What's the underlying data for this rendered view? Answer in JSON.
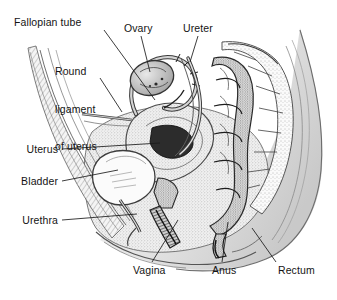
{
  "figure": {
    "width": 337,
    "height": 300,
    "background_color": "#ffffff",
    "ink_color": "#141414",
    "style": "grayscale pen-and-ink anatomical illustration with stippling and cross-hatching"
  },
  "labels": {
    "fallopian_tube": "Fallopian tube",
    "round_ligament_line1": "Round",
    "round_ligament_line2": "ligament",
    "round_ligament_line3": "of uterus",
    "ovary": "Ovary",
    "ureter": "Ureter",
    "uterus": "Uterus",
    "bladder": "Bladder",
    "urethra": "Urethra",
    "vagina": "Vagina",
    "anus": "Anus",
    "rectum": "Rectum"
  },
  "label_positions": {
    "fallopian_tube": {
      "x": 14,
      "y": 16,
      "align": "left"
    },
    "round_ligament": {
      "x": 55,
      "y": 40,
      "align": "left"
    },
    "ovary": {
      "x": 124,
      "y": 28,
      "align": "left"
    },
    "ureter": {
      "x": 183,
      "y": 28,
      "align": "left"
    },
    "uterus": {
      "x": 58,
      "y": 145,
      "align": "right"
    },
    "bladder": {
      "x": 58,
      "y": 177,
      "align": "right"
    },
    "urethra": {
      "x": 58,
      "y": 216,
      "align": "right"
    },
    "vagina": {
      "x": 133,
      "y": 265,
      "align": "left"
    },
    "anus": {
      "x": 212,
      "y": 265,
      "align": "left"
    },
    "rectum": {
      "x": 278,
      "y": 265,
      "align": "left"
    }
  },
  "leader_lines": {
    "fallopian_tube": {
      "from_x": 104,
      "from_y": 30,
      "to_x": 155,
      "to_y": 100
    },
    "round_ligament": {
      "from_x": 100,
      "from_y": 78,
      "to_x": 122,
      "to_y": 112
    },
    "ovary": {
      "from_x": 141,
      "from_y": 36,
      "to_x": 150,
      "to_y": 72
    },
    "ureter": {
      "from_x": 198,
      "from_y": 36,
      "to_x": 190,
      "to_y": 62
    },
    "uterus": {
      "from_x": 62,
      "from_y": 149,
      "to_x": 160,
      "to_y": 143
    },
    "bladder": {
      "from_x": 62,
      "from_y": 181,
      "to_x": 118,
      "to_y": 170
    },
    "urethra": {
      "from_x": 62,
      "from_y": 220,
      "to_x": 137,
      "to_y": 214
    },
    "vagina": {
      "from_x": 152,
      "from_y": 262,
      "to_x": 178,
      "to_y": 220
    },
    "anus": {
      "from_x": 222,
      "from_y": 262,
      "to_x": 228,
      "to_y": 222
    },
    "rectum": {
      "from_x": 276,
      "from_y": 262,
      "to_x": 252,
      "to_y": 228
    }
  },
  "structures": [
    {
      "name": "fallopian-tube",
      "description": "curved tube arching from uterine fundus toward ovary with fimbriated end"
    },
    {
      "name": "ovary",
      "description": "ovoid stippled body at upper center"
    },
    {
      "name": "round-ligament-of-uterus",
      "description": "thin fibrous band running anteriorly from uterus"
    },
    {
      "name": "ureter",
      "description": "slender tube descending from upper right toward bladder"
    },
    {
      "name": "uterus",
      "description": "anteverted pear-shaped organ with triangular cavity"
    },
    {
      "name": "bladder",
      "description": "pale oval cavity anterior and inferior to uterus"
    },
    {
      "name": "urethra",
      "description": "short canal descending from bladder neck"
    },
    {
      "name": "vagina",
      "description": "dark canal running inferoposteriorly from cervix"
    },
    {
      "name": "anus",
      "description": "terminal opening of anal canal"
    },
    {
      "name": "rectum",
      "description": "segmented haustrated tube anterior to sacrum"
    },
    {
      "name": "sacrum-vertebrae",
      "description": "stippled vertebral bodies along posterior wall"
    },
    {
      "name": "abdominal-wall",
      "description": "hatched anterior abdominal wall at left"
    },
    {
      "name": "gluteal-contour",
      "description": "shaded buttock contour at lower right"
    }
  ]
}
